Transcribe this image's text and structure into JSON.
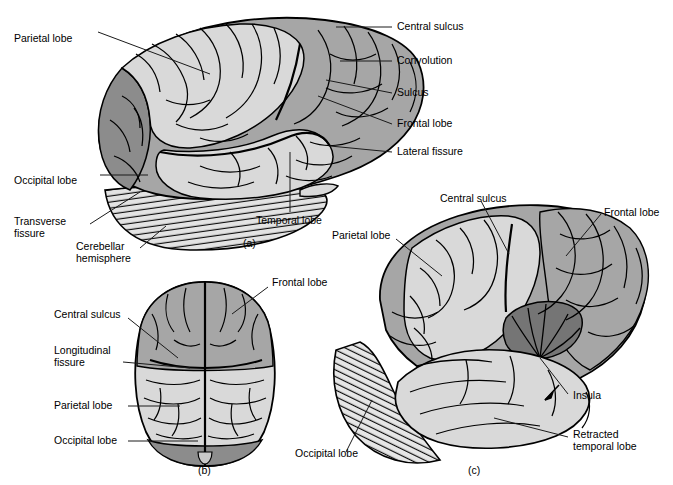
{
  "figure": {
    "background": "#ffffff",
    "line_color": "#000000"
  },
  "palette": {
    "light_gray": "#d9d9d9",
    "mid_gray": "#a6a6a6",
    "dark_gray": "#8c8c8c",
    "darkest_gray": "#757575",
    "cerebellum_fill": "#e0e0e0",
    "outline": "#000000",
    "text": "#000000",
    "leader_line": "#1a1a1a"
  },
  "panels": [
    {
      "id": "a",
      "caption": "(a)",
      "caption_pos": {
        "x": 243,
        "y": 237
      },
      "view": "lateral view of left cerebral hemisphere",
      "labels": [
        {
          "name": "parietal-lobe",
          "text": "Parietal lobe",
          "x": 14,
          "y": 33,
          "align": "left"
        },
        {
          "name": "occipital-lobe",
          "text": "Occipital lobe",
          "x": 14,
          "y": 175,
          "align": "left"
        },
        {
          "name": "transverse-fissure",
          "text": "Transverse\nfissure",
          "x": 14,
          "y": 222,
          "align": "left"
        },
        {
          "name": "cerebellar-hemisphere",
          "text": "Cerebellar\nhemisphere",
          "x": 76,
          "y": 247,
          "align": "left"
        },
        {
          "name": "temporal-lobe",
          "text": "Temporal lobe",
          "x": 256,
          "y": 215,
          "align": "left"
        },
        {
          "name": "central-sulcus",
          "text": "Central sulcus",
          "x": 397,
          "y": 22,
          "align": "left"
        },
        {
          "name": "convolution",
          "text": "Convolution",
          "x": 397,
          "y": 57,
          "align": "left"
        },
        {
          "name": "sulcus",
          "text": "Sulcus",
          "x": 397,
          "y": 89,
          "align": "left"
        },
        {
          "name": "frontal-lobe",
          "text": "Frontal lobe",
          "x": 397,
          "y": 119,
          "align": "left"
        },
        {
          "name": "lateral-fissure",
          "text": "Lateral fissure",
          "x": 397,
          "y": 148,
          "align": "left"
        }
      ]
    },
    {
      "id": "b",
      "caption": "(b)",
      "caption_pos": {
        "x": 198,
        "y": 466
      },
      "view": "superior view of the cerebrum",
      "labels": [
        {
          "name": "frontal-lobe",
          "text": "Frontal lobe",
          "x": 272,
          "y": 278,
          "align": "left"
        },
        {
          "name": "central-sulcus",
          "text": "Central sulcus",
          "x": 54,
          "y": 315,
          "align": "left"
        },
        {
          "name": "longitudinal-fissure",
          "text": "Longitudinal\nfissure",
          "x": 54,
          "y": 352,
          "align": "left"
        },
        {
          "name": "parietal-lobe",
          "text": "Parietal lobe",
          "x": 54,
          "y": 403,
          "align": "left"
        },
        {
          "name": "occipital-lobe",
          "text": "Occipital lobe",
          "x": 54,
          "y": 437,
          "align": "left"
        }
      ]
    },
    {
      "id": "c",
      "caption": "(c)",
      "caption_pos": {
        "x": 468,
        "y": 466
      },
      "view": "lateral view with temporal lobe retracted to expose the insula",
      "labels": [
        {
          "name": "central-sulcus",
          "text": "Central sulcus",
          "x": 440,
          "y": 194,
          "align": "left"
        },
        {
          "name": "frontal-lobe",
          "text": "Frontal lobe",
          "x": 604,
          "y": 208,
          "align": "left"
        },
        {
          "name": "parietal-lobe",
          "text": "Parietal lobe",
          "x": 332,
          "y": 231,
          "align": "left"
        },
        {
          "name": "insula",
          "text": "Insula",
          "x": 573,
          "y": 391,
          "align": "left"
        },
        {
          "name": "retracted-temporal-lobe",
          "text": "Retracted\ntemporal lobe",
          "x": 573,
          "y": 433,
          "align": "left"
        },
        {
          "name": "occipital-lobe",
          "text": "Occipital lobe",
          "x": 295,
          "y": 450,
          "align": "left"
        }
      ]
    }
  ]
}
